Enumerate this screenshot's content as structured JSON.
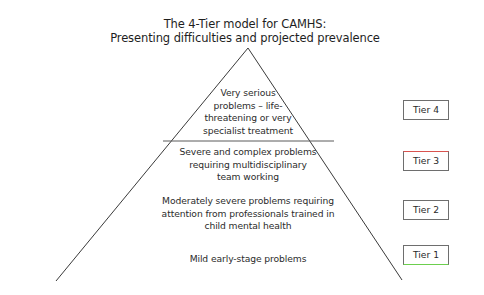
{
  "title": {
    "line1": "The 4-Tier model for CAMHS:",
    "line2": "Presenting difficulties and projected prevalence"
  },
  "pyramid": {
    "tiers": [
      {
        "tier": "Tier 4",
        "lines": [
          "Very serious",
          "problems – life-",
          "threatening or very",
          "specialist treatment"
        ],
        "accent": "#6e6e6e"
      },
      {
        "tier": "Tier 3",
        "lines": [
          "Severe and complex problems",
          "requiring multidisciplinary",
          "team working"
        ],
        "accent": "#d9534f"
      },
      {
        "tier": "Tier 2",
        "lines": [
          "Moderately severe problems requiring",
          "attention from professionals trained in",
          "child mental health"
        ],
        "accent": "#6e6e6e"
      },
      {
        "tier": "Tier 1",
        "lines": [
          "Mild early-stage problems"
        ],
        "accent": "#6ccf4e"
      }
    ],
    "divider_colors": [
      "#555555",
      "#4a5bd0",
      "#4a5bd0"
    ]
  }
}
